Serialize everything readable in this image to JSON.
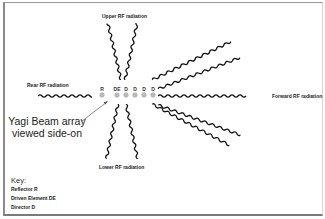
{
  "diagram": {
    "labels": {
      "upper": "Upper RF radiation",
      "lower": "Lower RF radiation",
      "rear": "Rear RF radiation",
      "forward": "Forward RF radiation",
      "array_line1": "Yagi Beam array",
      "array_line2": "viewed side-on"
    },
    "elements": [
      {
        "label": "R",
        "type": "Reflector"
      },
      {
        "label": "DE",
        "type": "Driven Element"
      },
      {
        "label": "D",
        "type": "Director"
      },
      {
        "label": "D",
        "type": "Director"
      },
      {
        "label": "D",
        "type": "Director"
      },
      {
        "label": "D",
        "type": "Director"
      }
    ],
    "key": {
      "title": "Key:",
      "items": [
        "Reflector R",
        "Driven Element DE",
        "Director D"
      ]
    },
    "colors": {
      "wave": "#111111",
      "element_fill": "#bdbdbd",
      "frame": "#8a8a8a"
    }
  }
}
